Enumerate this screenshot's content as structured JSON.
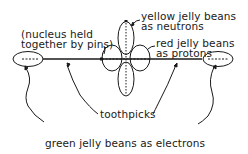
{
  "labels": {
    "nucleus": [
      "(nucleus held",
      "together by pins)"
    ],
    "neutrons": [
      "yellow jelly beans",
      "as neutrons"
    ],
    "protons": [
      "red jelly beans",
      "as protons"
    ],
    "toothpicks": "toothpicks",
    "electrons": "green jelly beans as electrons"
  },
  "colors": {
    "ink": "#1a1a1a",
    "background": "#ffffff"
  }
}
